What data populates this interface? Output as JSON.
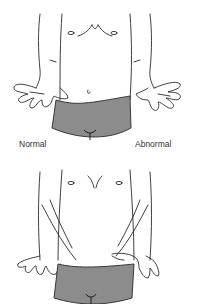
{
  "labels": {
    "normal": "Normal",
    "abnormal": "Abnormal"
  },
  "figures": [
    {
      "id": "top",
      "description": "Torso with both hands extended palms-up in front"
    },
    {
      "id": "bottom",
      "description": "Torso with both hands turned palms-down at hips"
    }
  ],
  "colors": {
    "outline": "#2a2a2a",
    "shorts": "#8c8c8c",
    "background": "#ffffff",
    "skin": "#ffffff"
  }
}
